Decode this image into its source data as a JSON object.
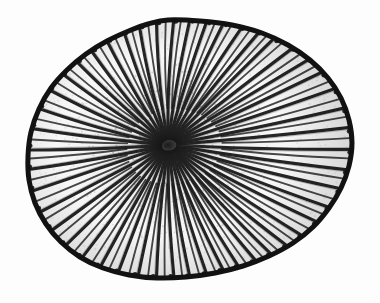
{
  "image": {
    "kind": "scientific-illustration",
    "subject_name": "solitary disc coral",
    "view": "oral (top-down) view of corallum",
    "technique": "engraving / stipple woodcut, monochrome line art",
    "caption": "",
    "title": "",
    "label": "",
    "background_color": "#fdfdfd",
    "ink_color": "#1a1a1a",
    "mid_tone_color": "#4a4a4a",
    "light_tone_color": "#8c8c8c",
    "canvas": {
      "width": 380,
      "height": 303
    }
  },
  "specimen": {
    "outline_shape": "irregular flattened oval, slightly angular upper-left, bulging right",
    "bounds": {
      "left": 28,
      "top": 20,
      "right": 352,
      "bottom": 278
    },
    "center_of_radiation": {
      "x": 168,
      "y": 145
    },
    "disc_center": {
      "x": 190,
      "y": 149
    },
    "radius_x": 162,
    "radius_y": 129,
    "rim": {
      "present": true,
      "thickness_px": 5,
      "color": "#121212",
      "edge_style": "scalloped / crenulated by septal ends"
    },
    "septa": {
      "count": 96,
      "description": "radiating septo-costae running from the dense central fossa to the margin",
      "major_count": 48,
      "minor_count": 48,
      "color": "#1c1c1c",
      "max_width_px": 3.2,
      "min_width_px": 0.8
    },
    "fossa": {
      "description": "dense dark central depression where septa converge",
      "x": 168,
      "y": 145,
      "radius_px": 26,
      "color": "#161616"
    },
    "outline_points": [
      [
        168,
        20
      ],
      [
        200,
        21
      ],
      [
        232,
        25
      ],
      [
        262,
        33
      ],
      [
        288,
        45
      ],
      [
        310,
        60
      ],
      [
        328,
        78
      ],
      [
        341,
        98
      ],
      [
        349,
        120
      ],
      [
        352,
        143
      ],
      [
        349,
        166
      ],
      [
        341,
        188
      ],
      [
        329,
        208
      ],
      [
        313,
        227
      ],
      [
        293,
        243
      ],
      [
        269,
        256
      ],
      [
        243,
        266
      ],
      [
        215,
        273
      ],
      [
        186,
        277
      ],
      [
        157,
        278
      ],
      [
        129,
        275
      ],
      [
        103,
        268
      ],
      [
        80,
        257
      ],
      [
        61,
        242
      ],
      [
        46,
        224
      ],
      [
        35,
        203
      ],
      [
        29,
        180
      ],
      [
        28,
        156
      ],
      [
        31,
        132
      ],
      [
        39,
        109
      ],
      [
        51,
        88
      ],
      [
        67,
        70
      ],
      [
        86,
        54
      ],
      [
        107,
        41
      ],
      [
        131,
        30
      ],
      [
        148,
        24
      ]
    ]
  },
  "texture": {
    "stipple": true,
    "stipple_dot_count": 1500,
    "grain_opacity": 0.5
  }
}
